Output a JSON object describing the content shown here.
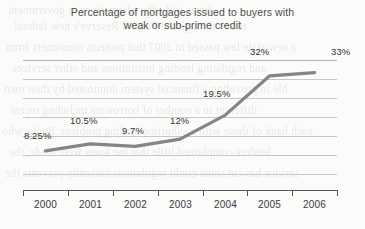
{
  "chart_data": {
    "type": "line",
    "title": "Percentage of mortgages issued to buyers with weak or sub-prime credit",
    "title_line1": "Percentage of mortgages issued to buyers with",
    "title_line2": "weak or sub-prime credit",
    "xlabel": "",
    "ylabel": "",
    "categories": [
      "2000",
      "2001",
      "2002",
      "2003",
      "2004",
      "2005",
      "2006"
    ],
    "values": [
      8.25,
      10.5,
      9.7,
      12,
      19.5,
      32,
      33
    ],
    "point_labels": [
      "8.25%",
      "10.5%",
      "9.7%",
      "12%",
      "19.5%",
      "32%",
      "33%"
    ],
    "ylim": [
      0,
      37
    ],
    "grid": true,
    "gridline_count": 7,
    "y_tick_labels": [],
    "legend": [],
    "legend_position": "none",
    "series": [
      {
        "name": "Percentage of mortgages to weak or sub-prime credit buyers",
        "values": [
          8.25,
          10.5,
          9.7,
          12,
          19.5,
          32,
          33
        ]
      }
    ],
    "colors": {
      "line": "#858585",
      "gridline": "#c8c8c8",
      "axis": "#555555",
      "title_text": "#4d4d4d",
      "label_text": "#333333",
      "background": "#fbfbfa"
    }
  },
  "bleed_text": [
    "firms still offer alternatives to government",
    "to see through the Federal Reserve's new federal",
    "a new state law passed in 2007 that protects consumers from",
    "and regulating lending institutions and other services",
    "ble in providing a financial system dominated by their own",
    "different in a number of borrowers including recent",
    "each bank of those with a subprime lending problem. Banks who",
    "lenders complained little that the loans were made, the",
    "service has cut some credit regulations currently prevents the"
  ]
}
